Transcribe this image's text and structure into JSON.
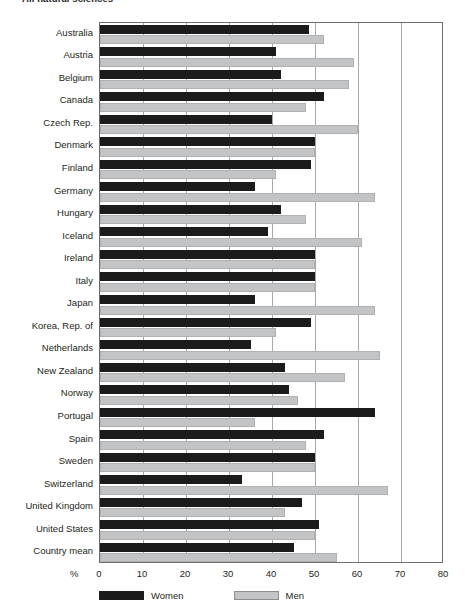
{
  "chart_data": {
    "type": "bar",
    "orientation": "horizontal",
    "title": "All natural sciences",
    "xlabel": "%",
    "ylabel": "",
    "xlim": [
      0,
      80
    ],
    "xticks": [
      0,
      10,
      20,
      30,
      40,
      50,
      60,
      70,
      80
    ],
    "grid": true,
    "grid_axis": "x",
    "legend_position": "bottom-left",
    "categories": [
      "Australia",
      "Austria",
      "Belgium",
      "Canada",
      "Czech Rep.",
      "Denmark",
      "Finland",
      "Germany",
      "Hungary",
      "Iceland",
      "Ireland",
      "Italy",
      "Japan",
      "Korea, Rep. of",
      "Netherlands",
      "New Zealand",
      "Norway",
      "Portugal",
      "Spain",
      "Sweden",
      "Switzerland",
      "United Kingdom",
      "United States",
      "Country mean"
    ],
    "series": [
      {
        "name": "Women",
        "color": "#1b1b1b",
        "values": [
          48.5,
          41,
          42,
          52,
          40,
          50,
          49,
          36,
          42,
          39,
          50,
          50,
          36,
          49,
          35,
          43,
          44,
          64,
          52,
          50,
          33,
          47,
          51,
          45
        ]
      },
      {
        "name": "Men",
        "color": "#c3c4c6",
        "values": [
          52,
          59,
          58,
          48,
          60,
          50,
          41,
          64,
          48,
          61,
          50,
          50,
          64,
          41,
          65,
          57,
          46,
          36,
          48,
          50,
          67,
          43,
          50,
          55
        ]
      }
    ]
  },
  "axis": {
    "percent_symbol": "%"
  },
  "colors": {
    "women": "#1b1b1b",
    "men": "#c3c4c6",
    "frame": "#6d6e71",
    "gridline": "#a7a9ac",
    "text": "#231f20"
  }
}
